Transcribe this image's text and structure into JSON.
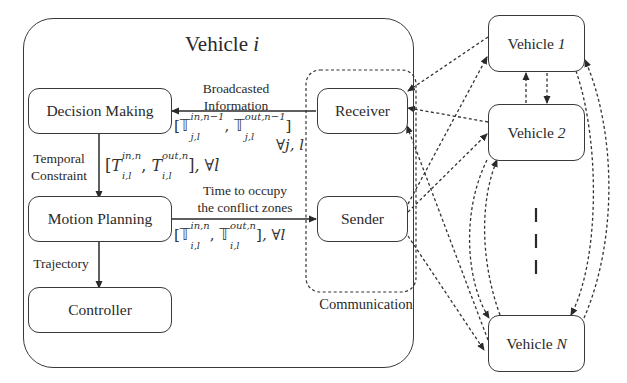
{
  "vehicle_i": {
    "title_prefix": "Vehicle ",
    "title_var": "i",
    "modules": {
      "decision_making": "Decision Making",
      "motion_planning": "Motion Planning",
      "controller": "Controller",
      "receiver": "Receiver",
      "sender": "Sender"
    },
    "communication_label": "Communication"
  },
  "edges": {
    "broadcasted_line1": "Broadcasted",
    "broadcasted_line2": "Information",
    "broadcast_math": "[𝕋_{j,l}^{in,n−1}, 𝕋_{j,l}^{out,n−1}] ∀j, l",
    "temporal_line1": "Temporal",
    "temporal_line2": "Constraint",
    "temporal_math": "[T_{i,l}^{in,n}, T_{i,l}^{out,n}], ∀l",
    "time_line1": "Time to occupy",
    "time_line2": "the conflict zones",
    "time_math": "[𝕋_{i,l}^{in,n}, 𝕋_{i,l}^{out,n}], ∀l",
    "trajectory": "Trajectory"
  },
  "math_parts": {
    "bbT": "𝕋",
    "T": "T",
    "open": "[",
    "close": "]",
    "comma": ",",
    "sub_jl": "j,l",
    "sub_il": "i,l",
    "sup_in_n1": "in,n−1",
    "sup_out_n1": "out,n−1",
    "sup_in_n": "in,n",
    "sup_out_n": "out,n",
    "forall_jl": "∀j, l",
    "forall_l": ", ∀l"
  },
  "other_vehicles": [
    {
      "prefix": "Vehicle ",
      "id": "1"
    },
    {
      "prefix": "Vehicle ",
      "id": "2"
    },
    {
      "prefix": "Vehicle ",
      "id": "N"
    }
  ],
  "ellipsis": "vertical-dashes"
}
